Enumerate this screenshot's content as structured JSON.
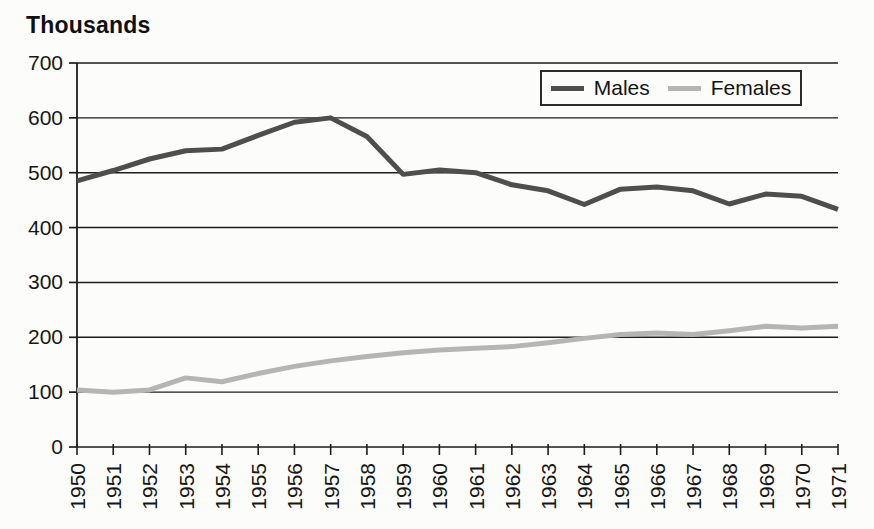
{
  "chart_data": {
    "type": "line",
    "title": "Thousands",
    "ylabel": "Thousands",
    "xlabel": "",
    "categories": [
      "1950",
      "1951",
      "1952",
      "1953",
      "1954",
      "1955",
      "1956",
      "1957",
      "1958",
      "1959",
      "1960",
      "1961",
      "1962",
      "1963",
      "1964",
      "1965",
      "1966",
      "1967",
      "1968",
      "1969",
      "1970",
      "1971"
    ],
    "series": [
      {
        "name": "Males",
        "color": "#4e4e4e",
        "values": [
          485,
          504,
          525,
          540,
          543,
          568,
          592,
          600,
          566,
          497,
          505,
          500,
          478,
          467,
          442,
          470,
          474,
          467,
          443,
          461,
          457,
          433
        ]
      },
      {
        "name": "Females",
        "color": "#b5b5b5",
        "values": [
          104,
          100,
          104,
          126,
          119,
          134,
          147,
          157,
          165,
          172,
          177,
          180,
          183,
          190,
          198,
          205,
          208,
          205,
          212,
          220,
          217,
          220
        ]
      }
    ],
    "ylim": [
      0,
      700
    ],
    "y_ticks": [
      0,
      100,
      200,
      300,
      400,
      500,
      600,
      700
    ],
    "grid": "horizontal",
    "legend_position": "top-right-inside",
    "axis_color": "#1d1d1d",
    "text_color": "#161616"
  }
}
